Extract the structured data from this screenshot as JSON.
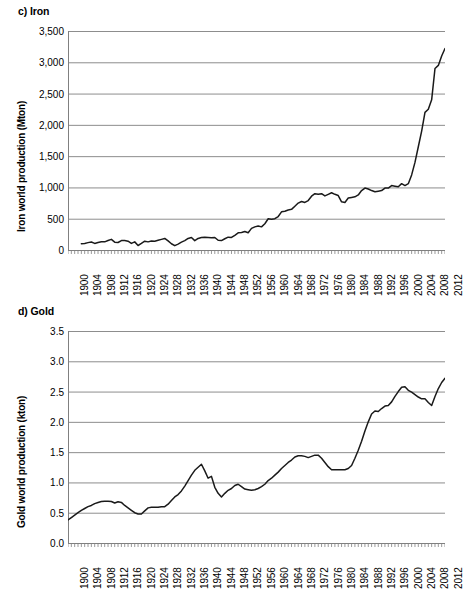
{
  "figure": {
    "background": "#ffffff",
    "line_color": "#1a1a1a",
    "grid_color": "#808080",
    "axis_color": "#808080"
  },
  "charts": [
    {
      "id": "iron",
      "title": "c) Iron",
      "ylabel": "Iron world production (Mton)",
      "xlabel": "",
      "yticks": [
        "0",
        "500",
        "1,000",
        "1,500",
        "2,000",
        "2,500",
        "3,000",
        "3,500"
      ],
      "xticks": [
        "1900",
        "1904",
        "1908",
        "1912",
        "1916",
        "1920",
        "1924",
        "1928",
        "1932",
        "1936",
        "1940",
        "1944",
        "1948",
        "1952",
        "1956",
        "1960",
        "1964",
        "1968",
        "1972",
        "1976",
        "1980",
        "1984",
        "1988",
        "1992",
        "1996",
        "2000",
        "2004",
        "2008",
        "2012"
      ]
    },
    {
      "id": "gold",
      "title": "d) Gold",
      "ylabel": "Gold world production (kton)",
      "xlabel": "",
      "yticks": [
        "0.0",
        "0.5",
        "1.0",
        "1.5",
        "2.0",
        "2.5",
        "3.0",
        "3.5"
      ],
      "xticks": [
        "1900",
        "1904",
        "1908",
        "1912",
        "1916",
        "1920",
        "1924",
        "1928",
        "1932",
        "1936",
        "1940",
        "1944",
        "1948",
        "1952",
        "1956",
        "1960",
        "1964",
        "1968",
        "1972",
        "1976",
        "1980",
        "1984",
        "1988",
        "1992",
        "1996",
        "2000",
        "2004",
        "2008",
        "2012"
      ]
    }
  ],
  "chart_data": [
    {
      "type": "line",
      "title": "c) Iron",
      "xlabel": "",
      "ylabel": "Iron world production (Mton)",
      "xlim": [
        1900,
        2013
      ],
      "ylim": [
        0,
        3500
      ],
      "grid": true,
      "legend": "none",
      "series": [
        {
          "name": "Iron world production",
          "x": [
            1904,
            1905,
            1906,
            1907,
            1908,
            1909,
            1910,
            1911,
            1912,
            1913,
            1914,
            1915,
            1916,
            1917,
            1918,
            1919,
            1920,
            1921,
            1922,
            1923,
            1924,
            1925,
            1926,
            1927,
            1928,
            1929,
            1930,
            1931,
            1932,
            1933,
            1934,
            1935,
            1936,
            1937,
            1938,
            1939,
            1940,
            1941,
            1942,
            1943,
            1944,
            1945,
            1946,
            1947,
            1948,
            1949,
            1950,
            1951,
            1952,
            1953,
            1954,
            1955,
            1956,
            1957,
            1958,
            1959,
            1960,
            1961,
            1962,
            1963,
            1964,
            1965,
            1966,
            1967,
            1968,
            1969,
            1970,
            1971,
            1972,
            1973,
            1974,
            1975,
            1976,
            1977,
            1978,
            1979,
            1980,
            1981,
            1982,
            1983,
            1984,
            1985,
            1986,
            1987,
            1988,
            1989,
            1990,
            1991,
            1992,
            1993,
            1994,
            1995,
            1996,
            1997,
            1998,
            1999,
            2000,
            2001,
            2002,
            2003,
            2004,
            2005,
            2006,
            2007,
            2008,
            2009,
            2010,
            2011,
            2012,
            2013
          ],
          "y": [
            100,
            105,
            118,
            128,
            105,
            120,
            132,
            130,
            152,
            170,
            125,
            120,
            150,
            150,
            140,
            105,
            130,
            72,
            105,
            140,
            130,
            145,
            140,
            155,
            170,
            185,
            145,
            100,
            70,
            95,
            125,
            150,
            185,
            200,
            150,
            185,
            200,
            205,
            200,
            195,
            200,
            155,
            150,
            180,
            205,
            200,
            235,
            275,
            280,
            295,
            275,
            345,
            370,
            385,
            370,
            420,
            500,
            490,
            500,
            535,
            610,
            620,
            640,
            650,
            700,
            750,
            775,
            760,
            790,
            860,
            900,
            890,
            900,
            865,
            890,
            915,
            890,
            870,
            770,
            760,
            830,
            840,
            850,
            880,
            950,
            990,
            975,
            950,
            930,
            940,
            950,
            990,
            990,
            1030,
            1020,
            1010,
            1060,
            1030,
            1060,
            1200,
            1400,
            1650,
            1900,
            2200,
            2250,
            2400,
            2900,
            2950,
            3100,
            3220
          ]
        }
      ]
    },
    {
      "type": "line",
      "title": "d) Gold",
      "xlabel": "",
      "ylabel": "Gold world production (kton)",
      "xlim": [
        1900,
        2013
      ],
      "ylim": [
        0.0,
        3.5
      ],
      "grid": true,
      "legend": "none",
      "series": [
        {
          "name": "Gold world production",
          "x": [
            1900,
            1901,
            1902,
            1903,
            1904,
            1905,
            1906,
            1907,
            1908,
            1909,
            1910,
            1911,
            1912,
            1913,
            1914,
            1915,
            1916,
            1917,
            1918,
            1919,
            1920,
            1921,
            1922,
            1923,
            1924,
            1925,
            1926,
            1927,
            1928,
            1929,
            1930,
            1931,
            1932,
            1933,
            1934,
            1935,
            1936,
            1937,
            1938,
            1939,
            1940,
            1941,
            1942,
            1943,
            1944,
            1945,
            1946,
            1947,
            1948,
            1949,
            1950,
            1951,
            1952,
            1953,
            1954,
            1955,
            1956,
            1957,
            1958,
            1959,
            1960,
            1961,
            1962,
            1963,
            1964,
            1965,
            1966,
            1967,
            1968,
            1969,
            1970,
            1971,
            1972,
            1973,
            1974,
            1975,
            1976,
            1977,
            1978,
            1979,
            1980,
            1981,
            1982,
            1983,
            1984,
            1985,
            1986,
            1987,
            1988,
            1989,
            1990,
            1991,
            1992,
            1993,
            1994,
            1995,
            1996,
            1997,
            1998,
            1999,
            2000,
            2001,
            2002,
            2003,
            2004,
            2005,
            2006,
            2007,
            2008,
            2009,
            2010,
            2011,
            2012,
            2013
          ],
          "y": [
            0.38,
            0.42,
            0.46,
            0.5,
            0.54,
            0.57,
            0.6,
            0.62,
            0.65,
            0.67,
            0.685,
            0.69,
            0.69,
            0.685,
            0.66,
            0.68,
            0.67,
            0.62,
            0.58,
            0.54,
            0.5,
            0.48,
            0.48,
            0.53,
            0.58,
            0.59,
            0.59,
            0.59,
            0.6,
            0.6,
            0.64,
            0.7,
            0.76,
            0.8,
            0.86,
            0.94,
            1.03,
            1.12,
            1.2,
            1.25,
            1.3,
            1.19,
            1.07,
            1.1,
            0.92,
            0.82,
            0.76,
            0.82,
            0.87,
            0.9,
            0.95,
            0.97,
            0.93,
            0.89,
            0.88,
            0.87,
            0.88,
            0.9,
            0.93,
            0.97,
            1.03,
            1.07,
            1.12,
            1.17,
            1.23,
            1.28,
            1.33,
            1.37,
            1.42,
            1.44,
            1.44,
            1.43,
            1.41,
            1.43,
            1.45,
            1.45,
            1.4,
            1.33,
            1.26,
            1.21,
            1.21,
            1.21,
            1.21,
            1.21,
            1.23,
            1.28,
            1.4,
            1.53,
            1.68,
            1.85,
            2.0,
            2.13,
            2.18,
            2.17,
            2.22,
            2.26,
            2.27,
            2.33,
            2.42,
            2.5,
            2.57,
            2.58,
            2.52,
            2.49,
            2.45,
            2.41,
            2.38,
            2.38,
            2.32,
            2.27,
            2.42,
            2.55,
            2.65,
            2.72,
            2.84
          ]
        }
      ]
    }
  ]
}
